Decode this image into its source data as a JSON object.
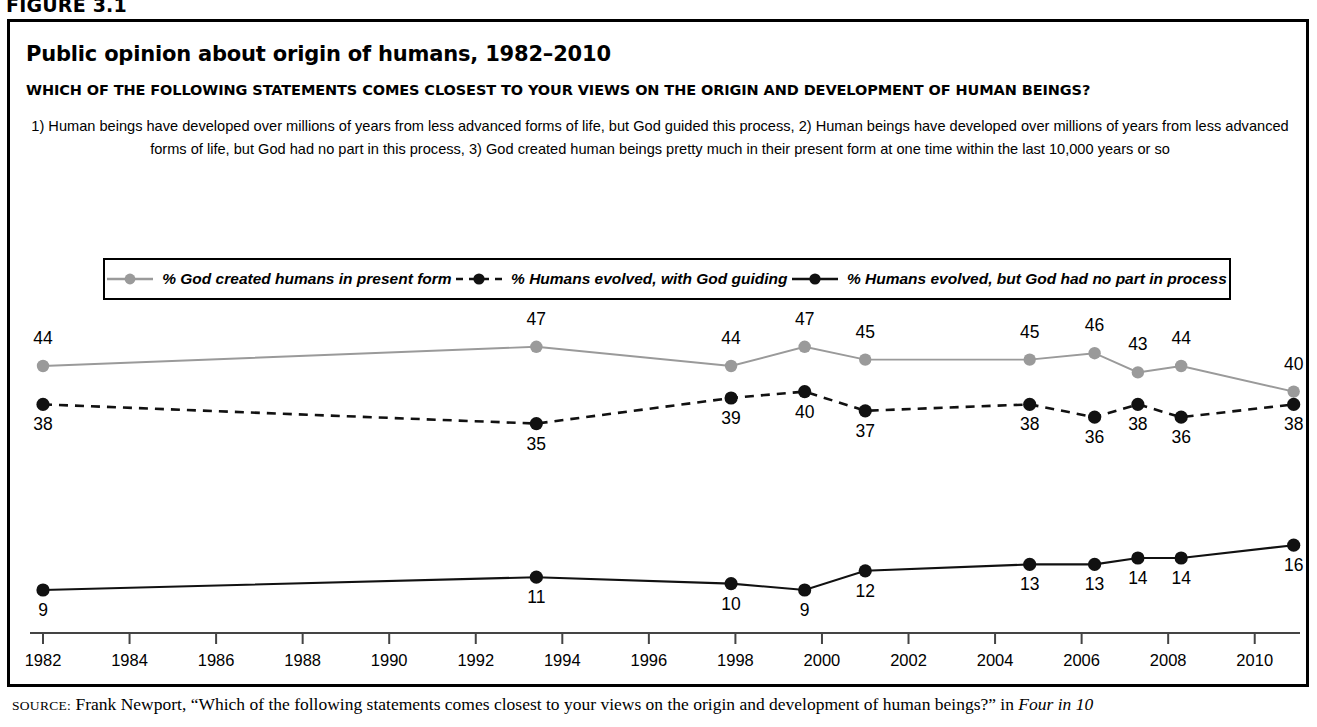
{
  "figure_label": "FIGURE 3.1",
  "title": "Public opinion about origin of humans, 1982–2010",
  "question": "WHICH OF THE FOLLOWING STATEMENTS COMES CLOSEST TO YOUR VIEWS ON THE ORIGIN AND DEVELOPMENT OF HUMAN BEINGS?",
  "subtitle_line1": "1) Human beings have developed over millions of years from less advanced forms of life, but God guided this process, 2) Human beings have developed over millions of years from",
  "subtitle_line2": "less advanced forms of life, but God had no part in this process, 3) God created human beings pretty much in their present form at one time within the last 10,000 years or so",
  "source": {
    "prefix": "SOURCE:",
    "text": " Frank Newport, “Which of the following statements comes closest to your views on the origin and development of human beings?” in ",
    "italic_tail": "Four in 10"
  },
  "legend": {
    "items": [
      {
        "label": "% God created humans in present form",
        "style": "solid",
        "color": "#9a9a9a",
        "marker": "circle"
      },
      {
        "label": "% Humans evolved, with God guiding",
        "style": "dashed",
        "color": "#111111",
        "marker": "circle"
      },
      {
        "label": "% Humans evolved, but God had no part in process",
        "style": "solid",
        "color": "#111111",
        "marker": "circle"
      }
    ]
  },
  "colors": {
    "gray_series": "#9a9a9a",
    "black_series": "#111111",
    "axis": "#444444",
    "border": "#000000"
  },
  "chart_data": {
    "type": "line",
    "title": "Public opinion about origin of humans, 1982–2010",
    "xlabel": "",
    "ylabel": "",
    "xlim": [
      1982,
      2011
    ],
    "ylim": [
      0,
      50
    ],
    "grid": false,
    "legend_position": "top",
    "xticks": [
      1982,
      1984,
      1986,
      1988,
      1990,
      1992,
      1994,
      1996,
      1998,
      2000,
      2002,
      2004,
      2006,
      2008,
      2010
    ],
    "xtick_labels": [
      "1982",
      "1984",
      "1986",
      "1988",
      "1990",
      "1992",
      "1994",
      "1996",
      "1998",
      "2000",
      "2002",
      "2004",
      "2006",
      "2008",
      "2010"
    ],
    "series": [
      {
        "name": "% God created humans in present form",
        "color": "#9a9a9a",
        "style": "solid",
        "x": [
          1982,
          1993.4,
          1997.9,
          1999.6,
          2001.0,
          2004.8,
          2006.3,
          2007.3,
          2008.3,
          2010.9
        ],
        "values": [
          44,
          47,
          44,
          47,
          45,
          45,
          46,
          43,
          44,
          40
        ],
        "label_positions": [
          "above",
          "above",
          "above",
          "above",
          "above",
          "above",
          "above",
          "above",
          "above",
          "above"
        ]
      },
      {
        "name": "% Humans evolved, with God guiding",
        "color": "#111111",
        "style": "dashed",
        "x": [
          1982,
          1993.4,
          1997.9,
          1999.6,
          2001.0,
          2004.8,
          2006.3,
          2007.3,
          2008.3,
          2010.9
        ],
        "values": [
          38,
          35,
          39,
          40,
          37,
          38,
          36,
          38,
          36,
          38
        ],
        "label_positions": [
          "below",
          "below",
          "below",
          "below",
          "below",
          "below",
          "below",
          "below",
          "below",
          "below"
        ]
      },
      {
        "name": "% Humans evolved, but God had no part in process",
        "color": "#111111",
        "style": "solid",
        "x": [
          1982,
          1993.4,
          1997.9,
          1999.6,
          2001.0,
          2004.8,
          2006.3,
          2007.3,
          2008.3,
          2010.9
        ],
        "values": [
          9,
          11,
          10,
          9,
          12,
          13,
          13,
          14,
          14,
          16
        ],
        "label_positions": [
          "below",
          "below",
          "below",
          "below",
          "below",
          "below",
          "below",
          "below",
          "below",
          "below"
        ]
      }
    ]
  }
}
